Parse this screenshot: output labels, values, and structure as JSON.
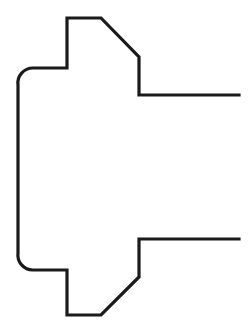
{
  "figure": {
    "title": "Technical line drawing of a bracket profile",
    "kind": "line-art-outline",
    "background_color": "#ffffff",
    "stroke_color": "#1a1a1a",
    "stroke_width": 3.2,
    "canvas": {
      "width": 250,
      "height": 335
    },
    "symmetry_axis_y": 166.5,
    "geometry": {
      "rounded_corner_radius": 15,
      "left_edge_x": 18,
      "notch_step_x": 67,
      "chamfer_start_x": 101,
      "chamfer_end_x": 139,
      "arm_end_x": 239,
      "top_edge_y": 18,
      "notch_shoulder_y": 68,
      "upper_arm_y": 95,
      "lower_arm_y": 239,
      "notch_shoulder_bottom_y": 270,
      "bottom_edge_y": 315
    },
    "vertices": [
      {
        "name": "upper-arm-right-end",
        "x": 239,
        "y": 95
      },
      {
        "name": "upper-arm-inner-corner",
        "x": 139,
        "y": 95
      },
      {
        "name": "upper-chamfer-bottom",
        "x": 139,
        "y": 57
      },
      {
        "name": "upper-chamfer-top",
        "x": 101,
        "y": 18
      },
      {
        "name": "top-edge-left",
        "x": 67,
        "y": 18
      },
      {
        "name": "upper-notch-shoulder",
        "x": 67,
        "y": 68
      },
      {
        "name": "upper-round-start",
        "x": 33,
        "y": 68
      },
      {
        "name": "upper-round-end",
        "x": 18,
        "y": 85
      },
      {
        "name": "lower-round-start",
        "x": 18,
        "y": 253
      },
      {
        "name": "lower-round-end",
        "x": 33,
        "y": 270
      },
      {
        "name": "lower-notch-shoulder",
        "x": 67,
        "y": 270
      },
      {
        "name": "bottom-edge-left",
        "x": 67,
        "y": 315
      },
      {
        "name": "lower-chamfer-bottom",
        "x": 101,
        "y": 315
      },
      {
        "name": "lower-chamfer-top",
        "x": 139,
        "y": 277
      },
      {
        "name": "lower-arm-inner-corner",
        "x": 139,
        "y": 239
      },
      {
        "name": "lower-arm-right-end",
        "x": 239,
        "y": 239
      }
    ],
    "path_d": "M 239 95 L 139 95 L 139 57 L 101 18 L 67 18 L 67 68 L 33 68 A 15 15 0 0 0 18 85 L 18 253 A 15 15 0 0 0 33 270 L 67 270 L 67 315 L 101 315 L 139 277 L 139 239 L 239 239"
  }
}
